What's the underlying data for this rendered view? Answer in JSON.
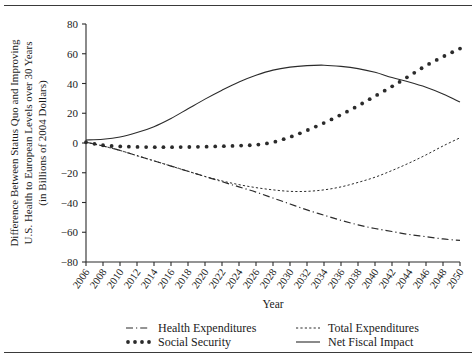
{
  "chart_data": {
    "type": "line",
    "title": "",
    "xlabel": "Year",
    "ylabel": "Difference Between Status Quo and Improving U.S. Health to European Levels over 30 Years (in Billions of 2004 Dollars)",
    "ylabel_lines": [
      "Difference Between Status Quo and Improving",
      "U.S. Health to European Levels over 30 Years",
      "(in Billions of 2004 Dollars)"
    ],
    "grid": false,
    "legend_position": "bottom",
    "xlim": [
      2006,
      2050
    ],
    "ylim": [
      -80,
      80
    ],
    "yticks": [
      80,
      60,
      40,
      20,
      0,
      -20,
      -40,
      -60,
      -80
    ],
    "ytick_labels": [
      "80",
      "60",
      "40",
      "20",
      "0",
      "−20",
      "−40",
      "−60",
      "−80"
    ],
    "x": [
      2006,
      2008,
      2010,
      2012,
      2014,
      2016,
      2018,
      2020,
      2022,
      2024,
      2026,
      2028,
      2030,
      2032,
      2034,
      2036,
      2038,
      2040,
      2042,
      2044,
      2046,
      2048,
      2050
    ],
    "xtick_labels": [
      "2006",
      "2008",
      "2010",
      "2012",
      "2014",
      "2016",
      "2018",
      "2020",
      "2022",
      "2024",
      "2026",
      "2028",
      "2030",
      "2032",
      "2034",
      "2036",
      "2038",
      "2040",
      "2042",
      "2044",
      "2046",
      "2048",
      "2050"
    ],
    "series": [
      {
        "name": "Health Expenditures",
        "style": "dashdot",
        "values": [
          0.5,
          -2.0,
          -5.0,
          -8.5,
          -12.0,
          -15.5,
          -19.0,
          -22.5,
          -26.0,
          -29.5,
          -33.0,
          -37.0,
          -41.0,
          -45.0,
          -48.5,
          -52.0,
          -55.0,
          -57.5,
          -59.5,
          -61.5,
          -63.0,
          -64.5,
          -65.5
        ]
      },
      {
        "name": "Total Expenditures",
        "style": "dashed",
        "values": [
          0.5,
          -2.0,
          -5.0,
          -8.5,
          -12.0,
          -15.5,
          -19.0,
          -22.5,
          -25.5,
          -28.0,
          -30.0,
          -31.5,
          -32.5,
          -32.5,
          -31.5,
          -29.5,
          -26.5,
          -23.0,
          -18.5,
          -13.5,
          -8.0,
          -2.0,
          3.5
        ]
      },
      {
        "name": "Social Security",
        "style": "dotted",
        "values": [
          0.5,
          -1.5,
          -2.3,
          -2.6,
          -2.8,
          -2.8,
          -2.7,
          -2.5,
          -2.2,
          -1.8,
          -1.2,
          0.5,
          4.0,
          8.5,
          13.5,
          19.0,
          25.0,
          31.5,
          38.0,
          45.0,
          52.0,
          58.0,
          63.5
        ]
      },
      {
        "name": "Net Fiscal Impact",
        "style": "solid",
        "values": [
          2.0,
          2.5,
          4.0,
          7.0,
          11.0,
          16.5,
          23.0,
          29.5,
          35.5,
          41.0,
          45.5,
          49.0,
          51.0,
          52.0,
          52.3,
          51.5,
          50.0,
          47.5,
          44.0,
          41.0,
          37.5,
          33.0,
          27.5
        ]
      }
    ],
    "legend": [
      {
        "label": "Health Expenditures",
        "style": "dashdot"
      },
      {
        "label": "Total Expenditures",
        "style": "dashed"
      },
      {
        "label": "Social Security",
        "style": "dotted"
      },
      {
        "label": "Net Fiscal Impact",
        "style": "solid"
      }
    ],
    "colors": {
      "ink": "#2b2b2b",
      "background": "#ffffff"
    }
  }
}
